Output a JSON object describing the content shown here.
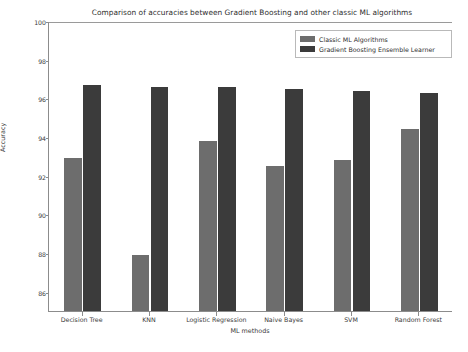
{
  "chart_data": {
    "type": "bar",
    "title": "Comparison of accuracies between Gradient Boosting and other classic ML algorithms",
    "xlabel": "ML methods",
    "ylabel": "Accuracy",
    "categories": [
      "Decision Tree",
      "KNN",
      "Logistic Regression",
      "Naive Bayes",
      "SVM",
      "Random Forest"
    ],
    "series": [
      {
        "name": "Classic ML Algorithms",
        "color": "#6d6d6d",
        "values": [
          92.9,
          87.9,
          93.8,
          92.5,
          92.8,
          94.4
        ]
      },
      {
        "name": "Gradient Boosting Ensemble Learner",
        "color": "#3b3b3b",
        "values": [
          96.7,
          96.6,
          96.6,
          96.5,
          96.4,
          96.3
        ]
      }
    ],
    "ylim": [
      85.0,
      100.0
    ],
    "yticks": [
      86,
      88,
      90,
      92,
      94,
      96,
      98,
      100
    ],
    "ytick_labels": [
      "86",
      "88",
      "90",
      "92",
      "94",
      "96",
      "98",
      "100"
    ],
    "grid": false,
    "legend_position": "upper right"
  },
  "legend": {
    "entries": [
      {
        "label": "Classic ML Algorithms",
        "swatch": "classic"
      },
      {
        "label": "Gradient Boosting Ensemble Learner",
        "swatch": "ensemble"
      }
    ]
  }
}
